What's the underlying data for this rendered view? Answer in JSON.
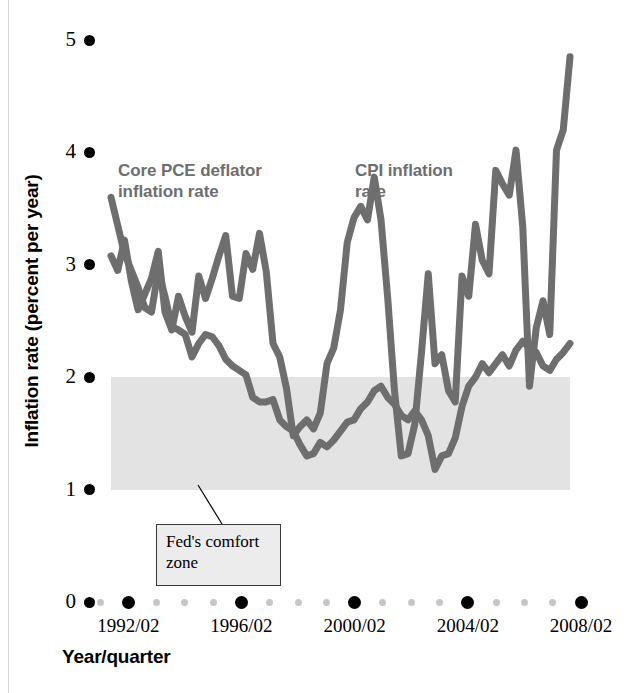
{
  "chart_data": {
    "type": "line",
    "title": "",
    "xlabel": "Year/quarter",
    "ylabel": "Inflation rate (percent per year)",
    "ylim": [
      0,
      5
    ],
    "yticks": [
      0,
      1,
      2,
      3,
      4,
      5
    ],
    "ytick_labels": [
      "0",
      "1",
      "2",
      "3",
      "4",
      "5"
    ],
    "xlim": [
      "1991/02",
      "2008/02"
    ],
    "xtick_labels": [
      "1992/02",
      "1996/02",
      "2000/02",
      "2004/02",
      "2008/02"
    ],
    "grid": false,
    "legend_position": "inline-annotations",
    "line_color": "#6e6e6e",
    "band_color": "#e3e3e3",
    "axis_dot_major_color": "#000000",
    "axis_dot_minor_color": "#c6c6c6",
    "annotations": [
      {
        "name": "core-pce-label",
        "text": "Core PCE deflator\ninflation rate",
        "line1": "Core PCE deflator",
        "line2": "inflation rate"
      },
      {
        "name": "cpi-label",
        "text": "CPI inflation\nrate",
        "line1": "CPI inflation",
        "line2": "rate"
      },
      {
        "name": "comfort-zone-callout",
        "line1": "Fed's comfort",
        "line2": "zone"
      }
    ],
    "bands": [
      {
        "name": "Fed's comfort zone",
        "y_start": 1,
        "y_end": 2,
        "color": "#e3e3e3"
      }
    ],
    "x": [
      "1991/02",
      "1991/03",
      "1991/04",
      "1992/01",
      "1992/02",
      "1992/03",
      "1992/04",
      "1993/01",
      "1993/02",
      "1993/03",
      "1993/04",
      "1994/01",
      "1994/02",
      "1994/03",
      "1994/04",
      "1995/01",
      "1995/02",
      "1995/03",
      "1995/04",
      "1996/01",
      "1996/02",
      "1996/03",
      "1996/04",
      "1997/01",
      "1997/02",
      "1997/03",
      "1997/04",
      "1998/01",
      "1998/02",
      "1998/03",
      "1998/04",
      "1999/01",
      "1999/02",
      "1999/03",
      "1999/04",
      "2000/01",
      "2000/02",
      "2000/03",
      "2000/04",
      "2001/01",
      "2001/02",
      "2001/03",
      "2001/04",
      "2002/01",
      "2002/02",
      "2002/03",
      "2002/04",
      "2003/01",
      "2003/02",
      "2003/03",
      "2003/04",
      "2004/01",
      "2004/02",
      "2004/03",
      "2004/04",
      "2005/01",
      "2005/02",
      "2005/03",
      "2005/04",
      "2006/01",
      "2006/02",
      "2006/03",
      "2006/04",
      "2007/01",
      "2007/02",
      "2007/03",
      "2007/04",
      "2008/01",
      "2008/02"
    ],
    "series": [
      {
        "name": "Core PCE deflator inflation rate",
        "label": "Core PCE deflator\ninflation rate",
        "color": "#6e6e6e",
        "values": [
          3.6,
          3.35,
          3.1,
          2.95,
          2.8,
          2.62,
          2.58,
          2.95,
          2.72,
          2.45,
          2.42,
          2.38,
          2.18,
          2.3,
          2.38,
          2.36,
          2.28,
          2.16,
          2.1,
          2.06,
          2.02,
          1.82,
          1.78,
          1.78,
          1.8,
          1.62,
          1.56,
          1.52,
          1.4,
          1.3,
          1.32,
          1.42,
          1.38,
          1.44,
          1.52,
          1.6,
          1.62,
          1.72,
          1.78,
          1.88,
          1.92,
          1.82,
          1.76,
          1.66,
          1.62,
          1.7,
          1.62,
          1.48,
          1.18,
          1.3,
          1.32,
          1.46,
          1.74,
          1.92,
          2.0,
          2.12,
          2.04,
          2.12,
          2.2,
          2.1,
          2.24,
          2.32,
          2.26,
          2.22,
          2.1,
          2.06,
          2.16,
          2.22,
          2.3
        ]
      },
      {
        "name": "CPI inflation rate",
        "label": "CPI inflation\nrate",
        "color": "#6e6e6e",
        "values": [
          3.08,
          2.95,
          3.22,
          2.86,
          2.6,
          2.74,
          2.88,
          3.12,
          2.58,
          2.42,
          2.72,
          2.54,
          2.4,
          2.9,
          2.7,
          2.88,
          3.08,
          3.26,
          2.72,
          2.7,
          3.1,
          2.96,
          3.28,
          2.94,
          2.3,
          2.18,
          1.9,
          1.48,
          1.56,
          1.62,
          1.54,
          1.68,
          2.12,
          2.26,
          2.6,
          3.2,
          3.42,
          3.52,
          3.4,
          3.78,
          3.4,
          2.7,
          1.88,
          1.3,
          1.32,
          1.58,
          2.22,
          2.92,
          2.12,
          2.2,
          1.88,
          1.78,
          2.9,
          2.72,
          3.36,
          3.04,
          2.92,
          3.84,
          3.72,
          3.62,
          4.02,
          3.34,
          1.92,
          2.44,
          2.68,
          2.38,
          4.02,
          4.2,
          4.85
        ]
      }
    ]
  },
  "figure": {
    "plot_left": 111,
    "plot_right": 570,
    "plot_top": 40,
    "plot_bottom": 602
  }
}
